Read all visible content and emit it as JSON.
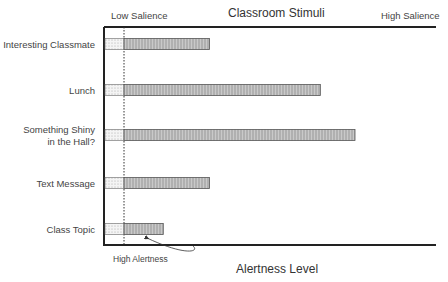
{
  "chart_data": {
    "type": "bar",
    "orientation": "horizontal",
    "title": "Classroom Stimuli",
    "xlabel": "Alertness Level",
    "scale_left_label": "Low Salience",
    "scale_right_label": "High Salience",
    "annotation": "High Alertness",
    "categories": [
      "Interesting Classmate",
      "Lunch",
      "Something Shiny|in the Hall?",
      "Text Message",
      "Class Topic"
    ],
    "values": [
      0.37,
      0.85,
      1.0,
      0.37,
      0.17
    ],
    "threshold": 0.0,
    "xlim": [
      -0.08,
      1.0
    ],
    "colors": {
      "bar": "#bdbdbd",
      "stipple": "#e8e8e8",
      "axis": "#222222"
    }
  }
}
